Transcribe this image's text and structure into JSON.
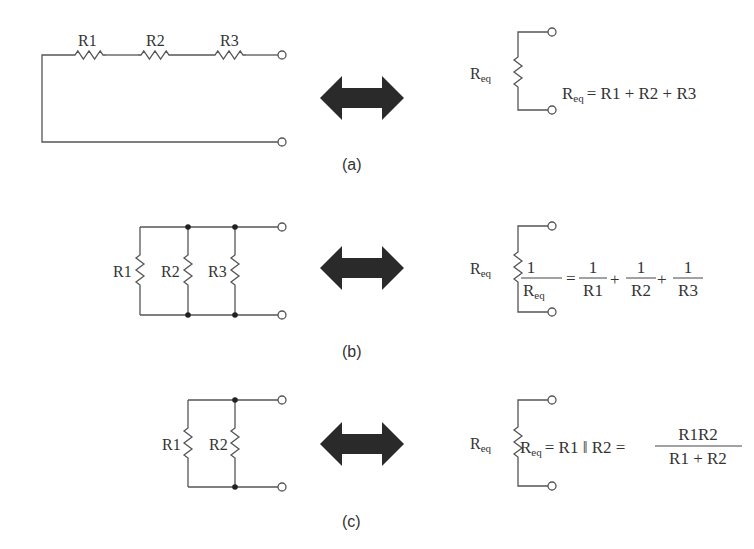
{
  "figure": {
    "panels": [
      {
        "id": "a",
        "caption": "(a)",
        "topology": "series",
        "resistors": [
          "R1",
          "R2",
          "R3"
        ],
        "equivalent_label": "R",
        "equivalent_sub": "eq",
        "equation": {
          "lhs": "R",
          "lhs_sub": "eq",
          "rhs": "= R1 + R2 + R3"
        }
      },
      {
        "id": "b",
        "caption": "(b)",
        "topology": "parallel",
        "resistors": [
          "R1",
          "R2",
          "R3"
        ],
        "equivalent_label": "R",
        "equivalent_sub": "eq",
        "equation": {
          "lhs_num": "1",
          "lhs_den": "R",
          "lhs_den_sub": "eq",
          "equals": "=",
          "terms": [
            {
              "num": "1",
              "den": "R1"
            },
            {
              "num": "1",
              "den": "R2"
            },
            {
              "num": "1",
              "den": "R3"
            }
          ],
          "plus": "+"
        }
      },
      {
        "id": "c",
        "caption": "(c)",
        "topology": "parallel",
        "resistors": [
          "R1",
          "R2"
        ],
        "equivalent_label": "R",
        "equivalent_sub": "eq",
        "equation": {
          "lhs": "R",
          "lhs_sub": "eq",
          "middle": "= R1 ‖ R2 =",
          "frac_num": "R1R2",
          "frac_den": "R1 + R2"
        }
      }
    ],
    "arrow_icon": "double-headed-arrow"
  }
}
